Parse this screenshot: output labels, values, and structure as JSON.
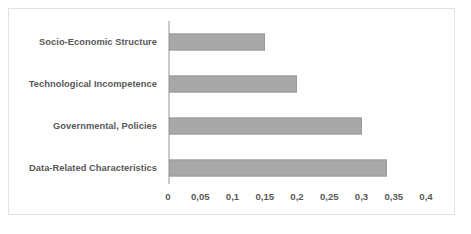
{
  "chart_data": {
    "type": "bar",
    "orientation": "horizontal",
    "title": "",
    "xlabel": "",
    "ylabel": "",
    "categories": [
      "Socio-Economic Structure",
      "Technological Incompetence",
      "Governmental, Policies",
      "Data-Related Characteristics"
    ],
    "values": [
      0.15,
      0.2,
      0.3,
      0.34
    ],
    "xlim": [
      0,
      0.4
    ],
    "xticks": [
      0,
      0.05,
      0.1,
      0.15,
      0.2,
      0.25,
      0.3,
      0.35,
      0.4
    ],
    "xtick_labels": [
      "0",
      "0,05",
      "0,1",
      "0,15",
      "0,2",
      "0,25",
      "0,3",
      "0,35",
      "0,4"
    ],
    "decimal_separator": ",",
    "grid": false,
    "legend": false,
    "bar_color": "#a8a8a8",
    "bar_border_color": "#9a9a9a",
    "axis_color": "#c9c9c9",
    "label_color": "#585858",
    "frame_color": "#e2e2e2",
    "background": "#ffffff"
  }
}
